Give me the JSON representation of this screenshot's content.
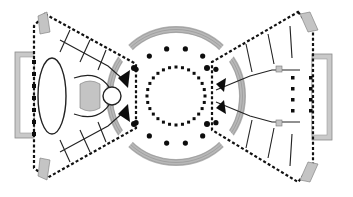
{
  "drawing": {
    "title": "Floor plan: central rotunda with two splayed wings",
    "type": "architectural-plan",
    "colors": {
      "wall": "#111111",
      "terrace": "#c9c9c9",
      "ring": "#b8b8b8",
      "background": "#ffffff"
    },
    "rotunda": {
      "center": [
        176,
        96
      ],
      "ring_outer_radius": 70,
      "ring_inner_radius": 63,
      "outer_colonnade_radius": 48,
      "outer_colonnade_count": 16,
      "inner_colonnade_radius": 29,
      "inner_colonnade_count": 28
    },
    "left_wing": {
      "terrace": {
        "x": 15,
        "y": 52,
        "width": 19,
        "height": 86
      },
      "oval_hall": {
        "cx": 52,
        "cy": 96,
        "rx": 14,
        "ry": 38
      }
    },
    "right_wing": {
      "terrace": {
        "x": 312,
        "y": 54,
        "width": 20,
        "height": 86
      },
      "colonnade_rows": 2,
      "colonnade_per_row": 6
    },
    "labels": []
  }
}
